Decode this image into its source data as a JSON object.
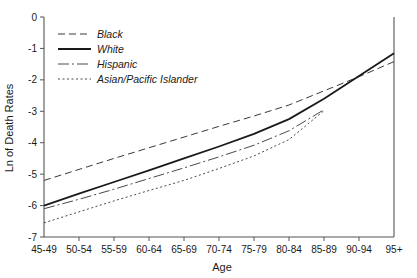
{
  "chart_data": {
    "type": "line",
    "title": "",
    "xlabel": "Age",
    "ylabel": "Ln of Death Rates",
    "categories": [
      "45-49",
      "50-54",
      "55-59",
      "60-64",
      "65-69",
      "70-74",
      "75-79",
      "80-84",
      "85-89",
      "90-94",
      "95+"
    ],
    "ylim": [
      -7,
      0
    ],
    "yticks": [
      0,
      -1,
      -2,
      -3,
      -4,
      -5,
      -6,
      -7
    ],
    "ytick_labels": [
      "0",
      "-1",
      "-2",
      "-3",
      "-4",
      "-5",
      "-6",
      "-7"
    ],
    "grid": false,
    "legend_position": "upper-left",
    "series": [
      {
        "name": "Black",
        "style": "dashed",
        "color": "#3a3a3a",
        "values": [
          -5.2,
          -4.85,
          -4.5,
          -4.16,
          -3.82,
          -3.48,
          -3.15,
          -2.8,
          -2.35,
          -1.9,
          -1.42
        ]
      },
      {
        "name": "White",
        "style": "solid",
        "color": "#1a1a1a",
        "values": [
          -6.0,
          -5.62,
          -5.25,
          -4.88,
          -4.5,
          -4.12,
          -3.72,
          -3.25,
          -2.6,
          -1.88,
          -1.15
        ]
      },
      {
        "name": "Hispanic",
        "style": "dash-dot",
        "color": "#4a4a4a",
        "values": [
          -6.1,
          -5.8,
          -5.48,
          -5.14,
          -4.8,
          -4.45,
          -4.08,
          -3.62,
          -2.95,
          null,
          null
        ]
      },
      {
        "name": "Asian/Pacific Islander",
        "style": "dotted",
        "color": "#4a4a4a",
        "values": [
          -6.55,
          -6.2,
          -5.85,
          -5.52,
          -5.2,
          -4.82,
          -4.42,
          -3.9,
          -2.98,
          null,
          null
        ]
      }
    ]
  },
  "legend": {
    "items": [
      {
        "label": "Black"
      },
      {
        "label": "White"
      },
      {
        "label": "Hispanic"
      },
      {
        "label": "Asian/Pacific Islander"
      }
    ]
  },
  "axes": {
    "x_title": "Age",
    "y_title": "Ln of Death Rates"
  }
}
